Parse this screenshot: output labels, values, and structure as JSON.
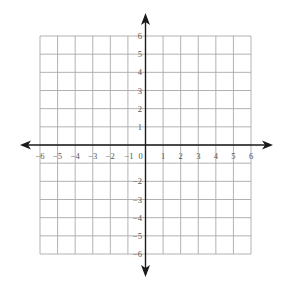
{
  "diagram": {
    "type": "coordinate-plane",
    "x_range": [
      -6,
      6
    ],
    "y_range": [
      -6,
      6
    ],
    "grid_step": 1,
    "x_tick_labels": [
      "−6",
      "−5",
      "−4",
      "−3",
      "−2",
      "−1",
      "0",
      "1",
      "2",
      "3",
      "4",
      "5",
      "6"
    ],
    "x_tick_values": [
      -6,
      -5,
      -4,
      -3,
      -2,
      -1,
      0,
      1,
      2,
      3,
      4,
      5,
      6
    ],
    "y_tick_labels_positive": [
      "1",
      "2",
      "3",
      "4",
      "5",
      "6"
    ],
    "y_tick_values_positive": [
      1,
      2,
      3,
      4,
      5,
      6
    ],
    "y_tick_labels_negative": [
      "−2",
      "−3",
      "−4",
      "−5",
      "−6"
    ],
    "y_tick_values_negative": [
      -2,
      -3,
      -4,
      -5,
      -6
    ],
    "axes": {
      "x_arrows": "both",
      "y_arrows": "both"
    },
    "colors": {
      "grid": "#a9a9a9",
      "axis": "#1a1a1a",
      "labels": "#555555",
      "background": "#ffffff"
    }
  }
}
